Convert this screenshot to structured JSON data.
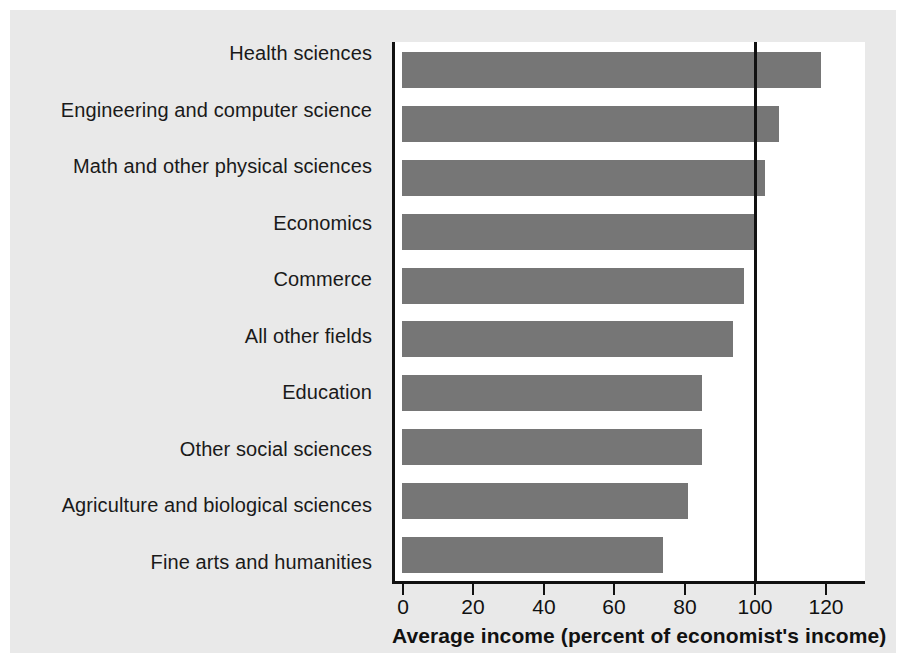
{
  "chart_data": {
    "type": "bar",
    "orientation": "horizontal",
    "title": "",
    "xlabel": "Average income (percent of economist's income)",
    "ylabel": "",
    "xlim": [
      0,
      134
    ],
    "xticks": [
      0,
      20,
      40,
      60,
      80,
      100,
      120
    ],
    "xtick_labels": [
      "0",
      "20",
      "40",
      "60",
      "80",
      "100",
      "120"
    ],
    "grid": false,
    "legend": null,
    "reference_line": 100,
    "categories": [
      "Health sciences",
      "Engineering and computer science",
      "Math and other physical sciences",
      "Economics",
      "Commerce",
      "All other fields",
      "Education",
      "Other social sciences",
      "Agriculture and biological sciences",
      "Fine arts and humanities"
    ],
    "values": [
      119,
      107,
      103,
      100,
      97,
      94,
      85,
      85,
      81,
      74
    ],
    "bar_color": "#767676",
    "axis_color": "#111111",
    "panel_background": "#e9e9e9",
    "plot_background": "#ffffff"
  }
}
